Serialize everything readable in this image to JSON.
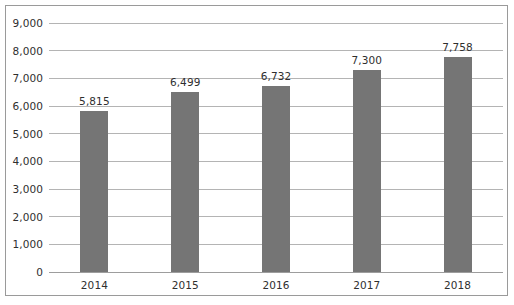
{
  "chart_data": {
    "type": "bar",
    "title": "",
    "subtitle": "",
    "xlabel": "",
    "ylabel": "",
    "categories": [
      "2014",
      "2015",
      "2016",
      "2017",
      "2018"
    ],
    "values": [
      5815,
      6499,
      6732,
      7300,
      7758
    ],
    "value_labels": [
      "5,815",
      "6,499",
      "6,732",
      "7,300",
      "7,758"
    ],
    "series": [
      {
        "name": "",
        "values": [
          5815,
          6499,
          6732,
          7300,
          7758
        ]
      }
    ],
    "ylim": [
      0,
      9000
    ],
    "ytick_values": [
      0,
      1000,
      2000,
      3000,
      4000,
      5000,
      6000,
      7000,
      8000,
      9000
    ],
    "ytick_labels": [
      "0",
      "1,000",
      "2,000",
      "3,000",
      "4,000",
      "5,000",
      "6,000",
      "7,000",
      "8,000",
      "9,000"
    ],
    "grid": true,
    "grid_axis": "y",
    "legend": false,
    "legend_position": "none",
    "bar_color": "#757575",
    "gridline_color": "#b4b4b4",
    "border_color": "#9a9a9a",
    "text_color": "#2f2f2f",
    "background_color": "#ffffff"
  }
}
